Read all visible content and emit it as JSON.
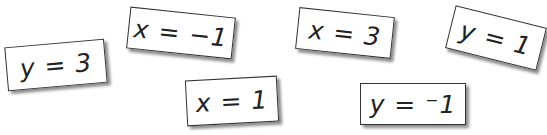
{
  "cards": [
    {
      "label": "y = 3"
    },
    {
      "label": "x = −1"
    },
    {
      "label": "x = 1"
    },
    {
      "label": "x = 3"
    },
    {
      "label": "y = 1"
    },
    {
      "label": "y = ⁻1"
    }
  ]
}
